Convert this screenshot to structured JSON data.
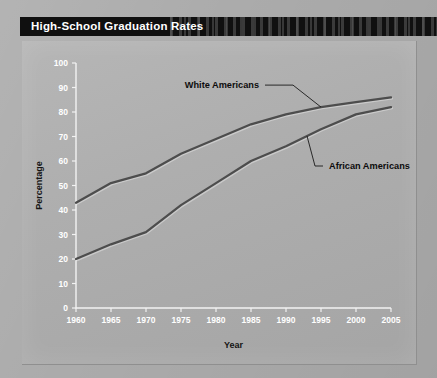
{
  "title": "High-School Graduation Rates",
  "axis": {
    "xlabel": "Year",
    "ylabel": "Percentage"
  },
  "chart_data": {
    "type": "line",
    "title": "High-School Graduation Rates",
    "xlabel": "Year",
    "ylabel": "Percentage",
    "xlim": [
      1960,
      2005
    ],
    "ylim": [
      0,
      100
    ],
    "grid": false,
    "legend": "inline-annotations",
    "x": [
      1960,
      1965,
      1970,
      1975,
      1980,
      1985,
      1990,
      1995,
      2000,
      2005
    ],
    "xticklabels": [
      "1960",
      "1965",
      "1970",
      "1975",
      "1980",
      "1985",
      "1990",
      "1995",
      "2000",
      "2005"
    ],
    "yticklabels": [
      "0",
      "10",
      "20",
      "30",
      "40",
      "50",
      "60",
      "70",
      "80",
      "90",
      "100"
    ],
    "series": [
      {
        "name": "White Americans",
        "values": [
          43,
          51,
          55,
          63,
          69,
          75,
          79,
          82,
          84,
          86
        ]
      },
      {
        "name": "African Americans",
        "values": [
          20,
          26,
          31,
          42,
          51,
          60,
          66,
          73,
          79,
          82
        ]
      }
    ],
    "annotations": [
      {
        "text": "White Americans",
        "series": "White Americans",
        "points_to_year": 1995
      },
      {
        "text": "African Americans",
        "series": "African Americans",
        "points_to_year": 1993
      }
    ]
  },
  "colors": {
    "title_band": "#101010",
    "title_text": "#ffffff",
    "panel_background": "#aeaeae",
    "axis": "#f2f2f2",
    "series_line": "#4d4d4d",
    "annotation_text": "#0d0d0d"
  }
}
